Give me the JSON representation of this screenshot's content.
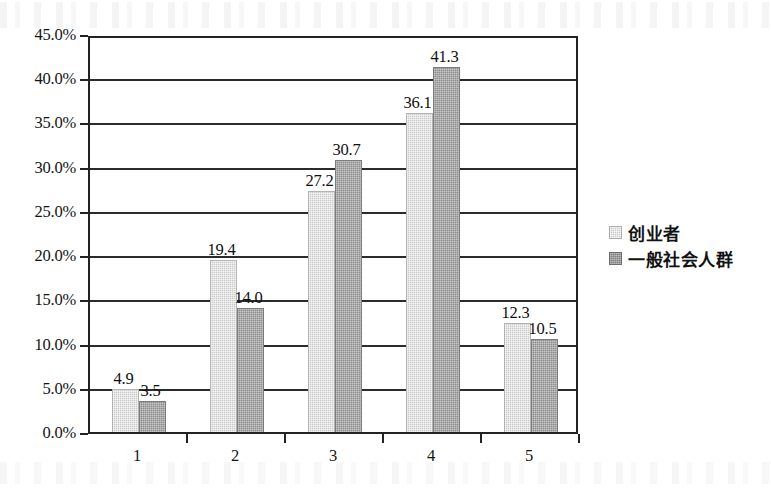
{
  "chart_data": {
    "type": "bar",
    "title": "",
    "subtitle": "",
    "xlabel": "",
    "ylabel": "",
    "categories": [
      "1",
      "2",
      "3",
      "4",
      "5"
    ],
    "series": [
      {
        "name": "创业者",
        "color": "#c9c9c9",
        "values": [
          4.9,
          19.4,
          27.2,
          36.1,
          12.3
        ],
        "labels": [
          "4.9",
          "19.4",
          "27.2",
          "36.1",
          "12.3"
        ]
      },
      {
        "name": "一般社会人群",
        "color": "#8d8d8d",
        "values": [
          3.5,
          14.0,
          30.7,
          41.3,
          10.5
        ],
        "labels": [
          "3.5",
          "14.0",
          "30.7",
          "41.3",
          "10.5"
        ]
      }
    ],
    "ylim": [
      0,
      45
    ],
    "ytick_values": [
      45,
      40,
      35,
      30,
      25,
      20,
      15,
      10,
      5,
      0
    ],
    "ytick_labels": [
      "45.0%",
      "40.0%",
      "35.0%",
      "30.0%",
      "25.0%",
      "20.0%",
      "15.0%",
      "10.0%",
      "5.0%",
      "0.0%"
    ],
    "grid": true,
    "legend_position": "right",
    "value_labels_shown": true
  },
  "legend": {
    "items": [
      {
        "label": "创业者",
        "swatch": "series-0-swatch"
      },
      {
        "label": "一般社会人群",
        "swatch": "series-1-swatch"
      }
    ]
  }
}
